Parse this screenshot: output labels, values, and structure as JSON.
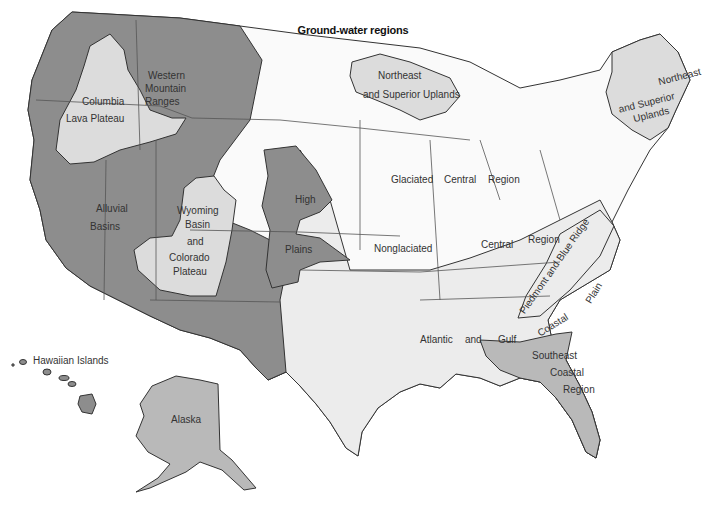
{
  "title": "Ground-water regions",
  "colors": {
    "background": "#ffffff",
    "dark_region": "#8d8d8d",
    "medium_region": "#b9b9b9",
    "light_region": "#dcdcdc",
    "very_light_region": "#ececec",
    "glaciated_region": "#fafafa",
    "border": "#333333"
  },
  "regions": [
    {
      "id": "western-mountain-ranges",
      "lines": [
        "Western",
        "Mountain",
        "Ranges"
      ],
      "shade": "dark"
    },
    {
      "id": "columbia-lava-plateau",
      "lines": [
        "Columbia",
        "Lava  Plateau"
      ],
      "shade": "light"
    },
    {
      "id": "alluvial-basins",
      "lines": [
        "Alluvial",
        "Basins"
      ],
      "shade": "dark"
    },
    {
      "id": "wyoming-basin-colorado-plateau",
      "lines": [
        "Wyoming",
        "Basin",
        "and",
        "Colorado",
        "Plateau"
      ],
      "shade": "light"
    },
    {
      "id": "high-plains",
      "lines": [
        "High",
        "Plains"
      ],
      "shade": "dark"
    },
    {
      "id": "northeast-superior-uplands-west",
      "lines": [
        "Northeast",
        "and Superior Uplands"
      ],
      "shade": "light"
    },
    {
      "id": "northeast-superior-uplands-east",
      "lines": [
        "Northeast",
        "and Superior",
        "Uplands"
      ],
      "shade": "light"
    },
    {
      "id": "glaciated-central-region",
      "lines": [
        "Glaciated",
        "Central",
        "Region"
      ],
      "shade": "white"
    },
    {
      "id": "nonglaciated-central-region",
      "lines": [
        "Nonglaciated",
        "Central",
        "Region"
      ],
      "shade": "very-light"
    },
    {
      "id": "piedmont-blue-ridge",
      "lines": [
        "Piedmont and Blue Ridge"
      ],
      "shade": "very-light"
    },
    {
      "id": "atlantic-gulf-coastal-plain",
      "lines": [
        "Atlantic",
        "and",
        "Gulf",
        "Coastal",
        "Plain"
      ],
      "shade": "very-light"
    },
    {
      "id": "southeast-coastal-region",
      "lines": [
        "Southeast",
        "Coastal",
        "Region"
      ],
      "shade": "medium"
    },
    {
      "id": "alaska",
      "lines": [
        "Alaska"
      ],
      "shade": "medium"
    },
    {
      "id": "hawaiian-islands",
      "lines": [
        "Hawaiian Islands"
      ],
      "shade": "dark"
    }
  ]
}
